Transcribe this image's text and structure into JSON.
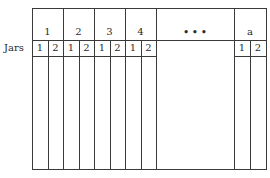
{
  "diagram": {
    "row_label": "Jars",
    "groups": [
      {
        "label": "1",
        "subs": [
          "1",
          "2"
        ]
      },
      {
        "label": "2",
        "subs": [
          "1",
          "2"
        ]
      },
      {
        "label": "3",
        "subs": [
          "1",
          "2"
        ]
      },
      {
        "label": "4",
        "subs": [
          "1",
          "2"
        ]
      },
      {
        "label": "• • •",
        "subs": []
      },
      {
        "label": "a",
        "subs": [
          "1",
          "2"
        ]
      }
    ]
  }
}
